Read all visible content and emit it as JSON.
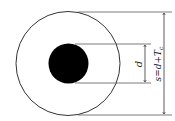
{
  "diagram": {
    "title": "",
    "labels": {
      "inner_dimension": "d",
      "outer_dimension_prefix": "s=d+T",
      "outer_dimension_subscript": "c"
    },
    "colors": {
      "line": "#333333",
      "core_fill": "#000000",
      "background": "#ffffff"
    }
  }
}
